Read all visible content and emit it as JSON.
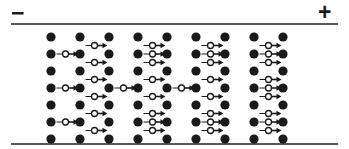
{
  "figure": {
    "width": 349,
    "height": 149,
    "background": "#ffffff",
    "caption_text": ""
  },
  "terminals": {
    "negative": {
      "label": "−",
      "name": "negative-terminal",
      "x": 11,
      "y": 2
    },
    "positive": {
      "label": "+",
      "name": "positive-terminal",
      "x": 318,
      "y": 1
    }
  },
  "electrodes": {
    "color": "#555a5c",
    "thickness": 2,
    "left": 11,
    "width": 327,
    "top_y": 23,
    "bottom_y": 143
  },
  "lattice": {
    "ion_color": "#1a1a1a",
    "ion_radius": 4.6,
    "columns": 9,
    "rows": 7,
    "column_x": [
      51,
      80,
      109,
      138,
      167,
      196,
      225,
      254,
      283
    ],
    "row_y": [
      37,
      54,
      71,
      88,
      105,
      122,
      139
    ],
    "x_step": 29,
    "y_step": 17
  },
  "electrons": {
    "fill": "#ffffff",
    "stroke": "#1a1a1a",
    "stroke_width": 1.3,
    "radius": 3.0,
    "arrow_color": "#1a1a1a",
    "arrow_shaft_width": 1.6,
    "arrow_head_length": 5,
    "arrow_head_width": 5.5,
    "arrow_length": 13,
    "direction": "right",
    "legend": "electron drifting toward positive terminal",
    "on_row": [
      {
        "row": 1,
        "col": 0
      },
      {
        "row": 1,
        "col": 3
      },
      {
        "row": 1,
        "col": 5
      },
      {
        "row": 1,
        "col": 7
      },
      {
        "row": 3,
        "col": 0
      },
      {
        "row": 3,
        "col": 2
      },
      {
        "row": 3,
        "col": 4
      },
      {
        "row": 3,
        "col": 7
      },
      {
        "row": 5,
        "col": 0
      },
      {
        "row": 5,
        "col": 3
      },
      {
        "row": 5,
        "col": 5
      },
      {
        "row": 5,
        "col": 7
      }
    ],
    "off_row": [
      {
        "row": 0,
        "col": 2
      },
      {
        "row": 0,
        "col": 4
      },
      {
        "row": 0,
        "col": 6
      },
      {
        "row": 0,
        "col": 8
      },
      {
        "row": 1,
        "col": 2
      },
      {
        "row": 1,
        "col": 4
      },
      {
        "row": 1,
        "col": 6
      },
      {
        "row": 1,
        "col": 8
      },
      {
        "row": 2,
        "col": 2
      },
      {
        "row": 2,
        "col": 4
      },
      {
        "row": 2,
        "col": 6
      },
      {
        "row": 2,
        "col": 8
      },
      {
        "row": 3,
        "col": 2
      },
      {
        "row": 3,
        "col": 4
      },
      {
        "row": 3,
        "col": 6
      },
      {
        "row": 3,
        "col": 8
      },
      {
        "row": 4,
        "col": 2
      },
      {
        "row": 4,
        "col": 4
      },
      {
        "row": 4,
        "col": 6
      },
      {
        "row": 4,
        "col": 8
      },
      {
        "row": 5,
        "col": 2
      },
      {
        "row": 5,
        "col": 4
      },
      {
        "row": 5,
        "col": 6
      },
      {
        "row": 5,
        "col": 8
      }
    ]
  }
}
